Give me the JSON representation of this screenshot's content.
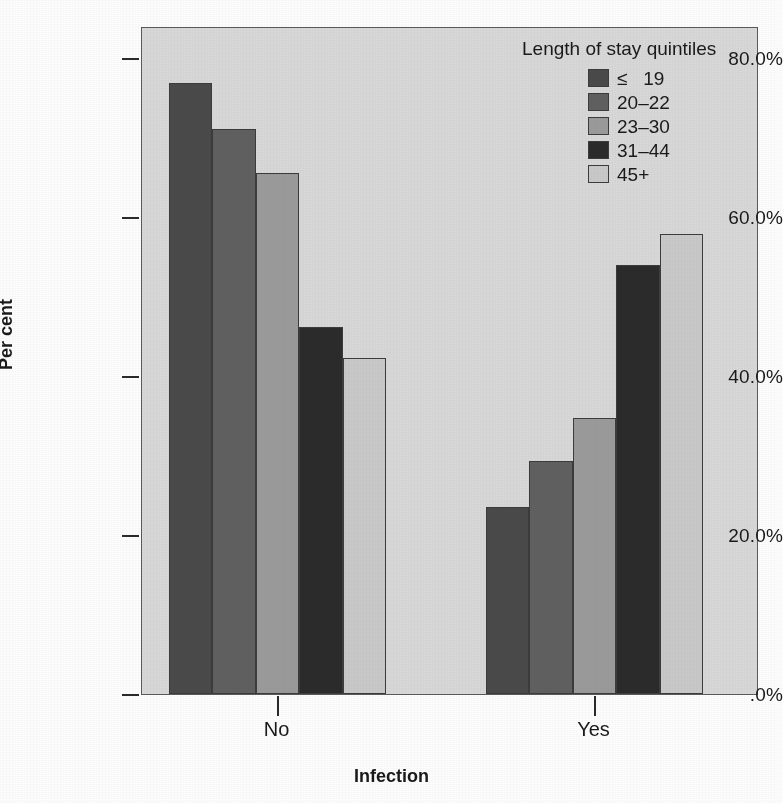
{
  "chart_data": {
    "type": "bar",
    "title": "",
    "subtitle": "",
    "xlabel": "Infection",
    "ylabel": "Per cent",
    "categories": [
      "No",
      "Yes"
    ],
    "series": [
      {
        "name": "≤   19",
        "values": [
          76.8,
          23.5
        ],
        "color": "#4a4a4a"
      },
      {
        "name": "20–22",
        "values": [
          71.0,
          29.3
        ],
        "color": "#606060"
      },
      {
        "name": "23–30",
        "values": [
          65.5,
          34.7
        ],
        "color": "#9b9b9b"
      },
      {
        "name": "31–44",
        "values": [
          46.2,
          53.9
        ],
        "color": "#2b2b2b"
      },
      {
        "name": "45+",
        "values": [
          42.3,
          57.9
        ],
        "color": "#c9c9c9"
      }
    ],
    "ylim": [
      0,
      84
    ],
    "ytick_values": [
      0,
      20,
      40,
      60,
      80
    ],
    "ytick_labels": [
      ".0%",
      "20.0%",
      "40.0%",
      "60.0%",
      "80.0%"
    ],
    "grid": false,
    "legend_position": "top-right",
    "legend_title": "Length of stay quintiles",
    "plot_background": "#d8d8d8",
    "page_background": "#fdfdfd"
  },
  "axes": {
    "y_title": "Per cent",
    "x_title": "Infection"
  },
  "legend": {
    "title": "Length of stay quintiles",
    "items": [
      {
        "label": "≤   19",
        "color": "#4a4a4a"
      },
      {
        "label": "20–22",
        "color": "#606060"
      },
      {
        "label": "23–30",
        "color": "#9b9b9b"
      },
      {
        "label": "31–44",
        "color": "#2b2b2b"
      },
      {
        "label": "45+",
        "color": "#c9c9c9"
      }
    ]
  }
}
